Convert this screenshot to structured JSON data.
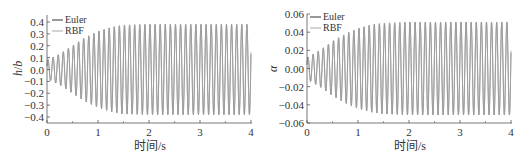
{
  "chart_data": [
    {
      "type": "line",
      "title": "",
      "xlabel": "时间/s",
      "ylabel": "h/b",
      "xlim": [
        0,
        4
      ],
      "ylim": [
        -0.4,
        0.4
      ],
      "xticks": [
        "0",
        "1",
        "2",
        "3",
        "4"
      ],
      "yticks": [
        "0.4",
        "0.3",
        "0.2",
        "0.1",
        "0.0",
        "-0.1",
        "-0.2",
        "-0.3",
        "-0.4"
      ],
      "grid": false,
      "legend_position": "upper-left",
      "series": [
        {
          "name": "Euler",
          "color": "#333333",
          "description": "growing oscillation from ~0.08 amplitude to saturated ~0.38 by t≈1.5s, ~10 Hz"
        },
        {
          "name": "RBF",
          "color": "#aaaaaa",
          "description": "nearly identical to Euler"
        }
      ],
      "envelope": {
        "t": [
          0,
          0.25,
          0.5,
          0.75,
          1.0,
          1.25,
          1.5,
          2.0,
          4.0
        ],
        "amplitude": [
          0.08,
          0.13,
          0.2,
          0.27,
          0.32,
          0.355,
          0.375,
          0.38,
          0.38
        ]
      },
      "frequency_hz": 10
    },
    {
      "type": "line",
      "title": "",
      "xlabel": "时间/s",
      "ylabel": "α",
      "xlim": [
        0,
        4
      ],
      "ylim": [
        -0.06,
        0.06
      ],
      "xticks": [
        "0",
        "1",
        "2",
        "3",
        "4"
      ],
      "yticks": [
        "0.06",
        "0.04",
        "0.02",
        "0.00",
        "-0.02",
        "-0.04",
        "-0.06"
      ],
      "grid": false,
      "legend_position": "upper-left",
      "series": [
        {
          "name": "Euler",
          "color": "#333333",
          "description": "growing oscillation from ~0.012 amplitude to saturated ~0.05 by t≈1.5s, ~10 Hz"
        },
        {
          "name": "RBF",
          "color": "#aaaaaa",
          "description": "nearly identical to Euler"
        }
      ],
      "envelope": {
        "t": [
          0,
          0.25,
          0.5,
          0.75,
          1.0,
          1.25,
          1.5,
          2.0,
          4.0
        ],
        "amplitude": [
          0.012,
          0.02,
          0.03,
          0.038,
          0.044,
          0.048,
          0.05,
          0.051,
          0.051
        ]
      },
      "frequency_hz": 10
    }
  ],
  "legend": {
    "euler": "Euler",
    "rbf": "RBF"
  },
  "left": {
    "ylabel_h": "h",
    "ylabel_sep": "/",
    "ylabel_b": "b",
    "xlabel": "时间/s"
  },
  "right": {
    "ylabel": "α",
    "xlabel": "时间/s"
  }
}
